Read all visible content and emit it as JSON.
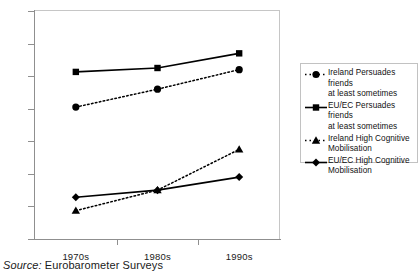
{
  "chart_data": {
    "type": "line",
    "title": "",
    "xlabel": "",
    "ylabel": "",
    "categories": [
      "1970s",
      "1980s",
      "1990s"
    ],
    "ylim": [
      0,
      70
    ],
    "yticks": [
      0,
      10,
      20,
      30,
      40,
      50,
      60,
      70
    ],
    "grid": false,
    "legend_position": "right",
    "series": [
      {
        "name": "Ireland Persuades friends at least sometimes",
        "values": [
          40.5,
          46.0,
          52.0
        ],
        "marker": "circle",
        "line_style": "dotted",
        "color": "#000000"
      },
      {
        "name": "EU/EC Persuades friends at least sometimes",
        "values": [
          51.3,
          52.5,
          57.0
        ],
        "marker": "square",
        "line_style": "solid",
        "color": "#000000"
      },
      {
        "name": "Ireland High Cognitive Mobilisation",
        "values": [
          8.7,
          15.0,
          27.5
        ],
        "marker": "triangle",
        "line_style": "dotted",
        "color": "#000000"
      },
      {
        "name": "EU/EC High Cognitive Mobilisation",
        "values": [
          12.8,
          15.0,
          19.0
        ],
        "marker": "diamond",
        "line_style": "solid",
        "color": "#000000"
      }
    ]
  },
  "legend": {
    "entries": [
      {
        "line1": "Ireland Persuades friends",
        "line2": "at least sometimes",
        "marker": "circle-marker-icon",
        "style": "dotted"
      },
      {
        "line1": "EU/EC Persuades friends",
        "line2": "at least sometimes",
        "marker": "square-marker-icon",
        "style": "solid"
      },
      {
        "line1": "Ireland High Cognitive",
        "line2": "Mobilisation",
        "marker": "triangle-marker-icon",
        "style": "dotted"
      },
      {
        "line1": "EU/EC High Cognitive",
        "line2": "Mobilisation",
        "marker": "diamond-marker-icon",
        "style": "solid"
      }
    ]
  },
  "caption": {
    "source_label": "Source:",
    "source_value": "Eurobarometer Surveys"
  },
  "axis": {
    "y_labels": [
      "70",
      "60",
      "50",
      "40",
      "30",
      "20",
      "10",
      "0"
    ],
    "x_labels": [
      "1970s",
      "1980s",
      "1990s"
    ]
  }
}
